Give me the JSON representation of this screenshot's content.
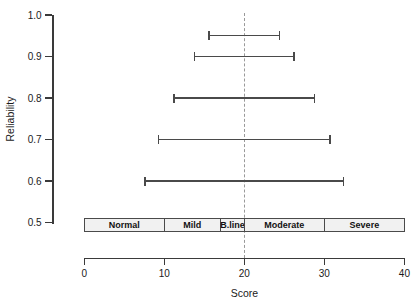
{
  "chart_data": {
    "type": "errorbar",
    "title": "",
    "xlabel": "Score",
    "ylabel": "Reliability",
    "xlim": [
      0,
      40
    ],
    "ylim": [
      0.5,
      1.0
    ],
    "x_ticks": [
      "0",
      "10",
      "20",
      "30",
      "40"
    ],
    "y_ticks": [
      "1.0",
      "0.9",
      "0.8",
      "0.7",
      "0.6",
      "0.5"
    ],
    "grid": "off",
    "legend": "none",
    "reference_line_x": 20,
    "series": [
      {
        "name": "score-confidence-interval",
        "points": [
          {
            "reliability": 0.95,
            "low": 15.6,
            "high": 24.4
          },
          {
            "reliability": 0.9,
            "low": 13.8,
            "high": 26.2
          },
          {
            "reliability": 0.8,
            "low": 11.2,
            "high": 28.8
          },
          {
            "reliability": 0.7,
            "low": 9.3,
            "high": 30.7
          },
          {
            "reliability": 0.6,
            "low": 7.6,
            "high": 32.4
          }
        ]
      }
    ],
    "bands": [
      {
        "label": "Normal",
        "from": 0,
        "to": 10
      },
      {
        "label": "Mild",
        "from": 10,
        "to": 17
      },
      {
        "label": "B.line",
        "from": 17,
        "to": 20
      },
      {
        "label": "Moderate",
        "from": 20,
        "to": 30
      },
      {
        "label": "Severe",
        "from": 30,
        "to": 40
      }
    ],
    "colors": {
      "axis": "#3a3a3a",
      "errorbar": "#4a4a4a",
      "reference": "#999999",
      "band_fill": "#f1f1f1",
      "band_border": "#4a4a4a",
      "text": "#1a1a1a",
      "background": "#ffffff"
    }
  }
}
